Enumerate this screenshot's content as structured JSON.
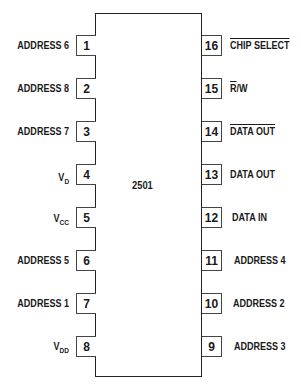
{
  "chip": {
    "part_number": "2501"
  },
  "left_pins": [
    {
      "num": "1",
      "label": "ADDRESS 6"
    },
    {
      "num": "2",
      "label": "ADDRESS 8"
    },
    {
      "num": "3",
      "label": "ADDRESS 7"
    },
    {
      "num": "4",
      "label": "V",
      "sub": "D"
    },
    {
      "num": "5",
      "label": "V",
      "sub": "CC"
    },
    {
      "num": "6",
      "label": "ADDRESS 5"
    },
    {
      "num": "7",
      "label": "ADDRESS 1"
    },
    {
      "num": "8",
      "label": "V",
      "sub": "DD"
    }
  ],
  "right_pins": [
    {
      "num": "16",
      "label": "CHIP SELECT",
      "overline": true
    },
    {
      "num": "15",
      "label_over": "R",
      "label": "/W"
    },
    {
      "num": "14",
      "label": "DATA OUT",
      "overline": true
    },
    {
      "num": "13",
      "label": "DATA OUT"
    },
    {
      "num": "12",
      "label": "DATA IN"
    },
    {
      "num": "11",
      "label": "ADDRESS 4"
    },
    {
      "num": "10",
      "label": "ADDRESS 2"
    },
    {
      "num": "9",
      "label": "ADDRESS 3"
    }
  ]
}
